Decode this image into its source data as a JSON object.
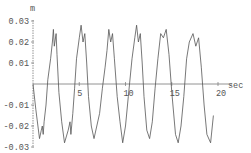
{
  "chart_data": {
    "type": "line",
    "title": "",
    "xlabel": "sec",
    "ylabel": "m",
    "xlim": [
      0,
      20
    ],
    "ylim": [
      -0.03,
      0.03
    ],
    "grid": false,
    "legend": null,
    "x_ticks": [
      5,
      10,
      15,
      20
    ],
    "x_tick_labels": [
      "5",
      "10",
      "15",
      "20"
    ],
    "y_ticks": [
      0.03,
      0.02,
      0.01,
      -0.01,
      -0.02,
      -0.03
    ],
    "y_tick_labels": [
      "0.03",
      "0.02",
      "0.01",
      "-0.01",
      "-0.02",
      "-0.03"
    ],
    "series": [
      {
        "name": "displacement",
        "color": "#555555",
        "x": [
          0,
          0.3,
          0.7,
          0.9,
          1.0,
          1.1,
          1.2,
          1.4,
          1.6,
          1.9,
          2.1,
          2.2,
          2.3,
          2.5,
          2.6,
          2.8,
          3.1,
          3.4,
          3.8,
          4.0,
          4.1,
          4.3,
          4.5,
          4.7,
          5.0,
          5.2,
          5.4,
          5.6,
          5.8,
          6.0,
          6.3,
          6.6,
          6.9,
          7.2,
          7.5,
          7.8,
          8.0,
          8.2,
          8.4,
          8.6,
          8.8,
          9.1,
          9.4,
          9.7,
          10.0,
          10.3,
          10.7,
          11.0,
          11.2,
          11.4,
          11.6,
          11.8,
          12.0,
          12.3,
          12.6,
          12.9,
          13.2,
          13.5,
          13.8,
          14.1,
          14.4,
          14.7,
          15.0,
          15.4,
          15.7,
          16.0,
          16.3,
          16.6,
          16.9,
          17.3,
          17.6,
          17.9,
          18.2,
          18.5,
          18.8,
          19.2,
          19.5
        ],
        "y": [
          0,
          -0.012,
          -0.026,
          -0.022,
          -0.02,
          -0.024,
          -0.018,
          -0.01,
          0.002,
          0.012,
          0.02,
          0.026,
          0.018,
          0.024,
          0.014,
          -0.004,
          -0.018,
          -0.028,
          -0.022,
          -0.018,
          -0.024,
          -0.014,
          -0.002,
          0.012,
          0.022,
          0.028,
          0.02,
          0.024,
          0.01,
          -0.006,
          -0.02,
          -0.026,
          -0.02,
          -0.014,
          -0.002,
          0.008,
          0.016,
          0.026,
          0.02,
          0.024,
          0.012,
          -0.006,
          -0.018,
          -0.028,
          -0.02,
          -0.006,
          0.012,
          0.022,
          0.028,
          0.02,
          0.024,
          0.01,
          -0.006,
          -0.022,
          -0.026,
          -0.018,
          -0.002,
          0.012,
          0.024,
          0.022,
          0.026,
          0.014,
          -0.004,
          -0.024,
          -0.028,
          -0.02,
          -0.006,
          0.012,
          0.02,
          0.024,
          0.018,
          0.022,
          0.008,
          -0.01,
          -0.024,
          -0.028,
          -0.015
        ]
      }
    ]
  }
}
